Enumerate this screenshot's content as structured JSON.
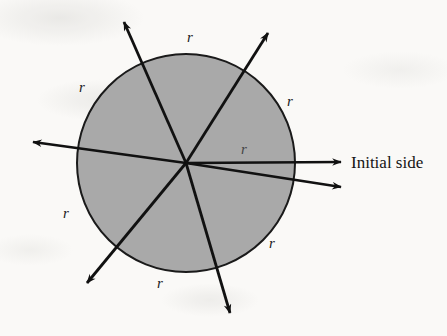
{
  "figure": {
    "type": "geometry-diagram",
    "background_color": "#faf9f7",
    "circle": {
      "center_x": 186,
      "center_y": 163,
      "radius": 109,
      "fill_color": "#a9a9a9",
      "stroke_color": "#1a1a1a",
      "stroke_width": 2
    },
    "caption": {
      "text": "Initial side",
      "x": 351,
      "y": 168
    },
    "rays": [
      {
        "name": "initial-side-ray",
        "angle_deg": 0,
        "tip_x": 341,
        "tip_y": 162
      },
      {
        "name": "ray-terminal-lower-right",
        "angle_deg": -9,
        "tip_x": 341,
        "tip_y": 187
      },
      {
        "name": "ray-upper-right",
        "angle_deg": 56,
        "tip_x": 268,
        "tip_y": 33
      },
      {
        "name": "ray-upper-left",
        "angle_deg": 112,
        "tip_x": 124,
        "tip_y": 22
      },
      {
        "name": "ray-left",
        "angle_deg": 172,
        "tip_x": 33,
        "tip_y": 142
      },
      {
        "name": "ray-lower-left",
        "angle_deg": 230,
        "tip_x": 87,
        "tip_y": 283
      },
      {
        "name": "ray-lower-right",
        "angle_deg": 287,
        "tip_x": 230,
        "tip_y": 313
      }
    ],
    "radius_labels": [
      {
        "name": "r-label-top",
        "text": "r",
        "x": 190,
        "y": 42
      },
      {
        "name": "r-label-upper-left",
        "text": "r",
        "x": 82,
        "y": 92
      },
      {
        "name": "r-label-upper-right",
        "text": "r",
        "x": 290,
        "y": 106
      },
      {
        "name": "r-label-center-right",
        "text": "r",
        "x": 244,
        "y": 154
      },
      {
        "name": "r-label-lower-left",
        "text": "r",
        "x": 66,
        "y": 218
      },
      {
        "name": "r-label-lower-right",
        "text": "r",
        "x": 272,
        "y": 248
      },
      {
        "name": "r-label-bottom",
        "text": "r",
        "x": 160,
        "y": 288
      }
    ]
  }
}
